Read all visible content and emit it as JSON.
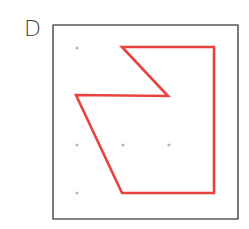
{
  "figure": {
    "label": "D",
    "frame": {
      "x1": 53,
      "y1": 25,
      "x2": 238,
      "y2": 219,
      "color": "#5a5a5a"
    },
    "grid_dots": {
      "color": "#b8b8b8",
      "points": [
        [
          77,
          48
        ],
        [
          77,
          145
        ],
        [
          123,
          145
        ],
        [
          169,
          145
        ],
        [
          77,
          193
        ]
      ]
    },
    "shape": {
      "color": "#e8433e",
      "points": "122,47 214,47 214,193 122,193 76,95 168,96"
    }
  }
}
